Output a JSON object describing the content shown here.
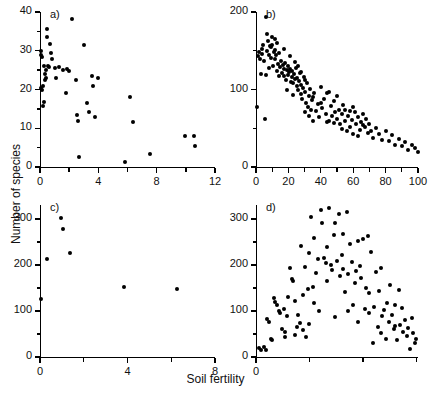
{
  "figure": {
    "xlabel": "Soil fertility",
    "ylabel": "Number of species",
    "point_color": "#000000",
    "axis_color": "#000000",
    "background": "#ffffff"
  },
  "chart_data": [
    {
      "type": "scatter",
      "panel": "a)",
      "title": "",
      "xlabel": "Soil fertility",
      "ylabel": "Number of species",
      "xlim": [
        0,
        12
      ],
      "ylim": [
        0,
        40
      ],
      "xticks": [
        0,
        4,
        8,
        12
      ],
      "xticklabels": [
        "0",
        "4",
        "8",
        "12"
      ],
      "xminorticks": [
        2,
        6,
        10
      ],
      "yticks": [
        0,
        10,
        20,
        30,
        40
      ],
      "yticklabels": [
        "0",
        "10",
        "20",
        "30",
        "40"
      ],
      "yminorticks": [
        5,
        15,
        25,
        35
      ],
      "grid": false,
      "legend": false,
      "points": [
        [
          0.05,
          30.0
        ],
        [
          0.08,
          29.0
        ],
        [
          0.1,
          20.3
        ],
        [
          0.12,
          20.0
        ],
        [
          0.15,
          28.5
        ],
        [
          0.18,
          21.0
        ],
        [
          0.2,
          15.8
        ],
        [
          0.25,
          16.8
        ],
        [
          0.3,
          26.0
        ],
        [
          0.32,
          24.0
        ],
        [
          0.35,
          22.5
        ],
        [
          0.38,
          25.0
        ],
        [
          0.42,
          23.0
        ],
        [
          0.45,
          33.5
        ],
        [
          0.5,
          35.5
        ],
        [
          0.55,
          26.0
        ],
        [
          0.6,
          25.8
        ],
        [
          0.7,
          31.8
        ],
        [
          0.75,
          29.5
        ],
        [
          0.85,
          27.8
        ],
        [
          1.0,
          25.5
        ],
        [
          1.1,
          23.0
        ],
        [
          1.3,
          25.8
        ],
        [
          1.6,
          25.0
        ],
        [
          1.75,
          19.2
        ],
        [
          1.85,
          25.2
        ],
        [
          2.0,
          24.8
        ],
        [
          2.2,
          38.2
        ],
        [
          2.45,
          22.5
        ],
        [
          2.55,
          13.5
        ],
        [
          2.6,
          11.8
        ],
        [
          2.7,
          2.5
        ],
        [
          3.05,
          31.5
        ],
        [
          3.2,
          16.5
        ],
        [
          3.35,
          14.2
        ],
        [
          3.55,
          23.5
        ],
        [
          3.6,
          20.8
        ],
        [
          3.75,
          13.0
        ],
        [
          4.0,
          23.0
        ],
        [
          5.8,
          1.2
        ],
        [
          6.2,
          18.0
        ],
        [
          6.35,
          11.7
        ],
        [
          7.55,
          3.3
        ],
        [
          9.95,
          7.9
        ],
        [
          10.55,
          8.0
        ],
        [
          10.65,
          5.5
        ]
      ]
    },
    {
      "type": "scatter",
      "panel": "b)",
      "title": "",
      "xlabel": "Soil fertility",
      "ylabel": "Number of species",
      "xlim": [
        0,
        100
      ],
      "ylim": [
        0,
        200
      ],
      "xticks": [
        0,
        20,
        40,
        60,
        80,
        100
      ],
      "xticklabels": [
        "0",
        "20",
        "40",
        "60",
        "80",
        "100"
      ],
      "xminorticks": [
        10,
        30,
        50,
        70,
        90
      ],
      "yticks": [
        0,
        100,
        200
      ],
      "yticklabels": [
        "0",
        "100",
        "200"
      ],
      "yminorticks": [
        50,
        150
      ],
      "grid": false,
      "legend": false,
      "points": [
        [
          0.5,
          77
        ],
        [
          1.5,
          143
        ],
        [
          2.0,
          148
        ],
        [
          2.5,
          140
        ],
        [
          3.0,
          120
        ],
        [
          3.5,
          152
        ],
        [
          4.0,
          146
        ],
        [
          4.5,
          158
        ],
        [
          5.0,
          137
        ],
        [
          5.5,
          62
        ],
        [
          6.0,
          193
        ],
        [
          6.5,
          171
        ],
        [
          7.0,
          150
        ],
        [
          7.5,
          162
        ],
        [
          8.0,
          145
        ],
        [
          8.5,
          156
        ],
        [
          9.0,
          141
        ],
        [
          9.5,
          155
        ],
        [
          10.0,
          158
        ],
        [
          10.5,
          130
        ],
        [
          11.0,
          148
        ],
        [
          11.5,
          151
        ],
        [
          12.0,
          139
        ],
        [
          12.5,
          144
        ],
        [
          13.0,
          124
        ],
        [
          13.5,
          133
        ],
        [
          14.0,
          147
        ],
        [
          14.5,
          118
        ],
        [
          15.0,
          129
        ],
        [
          15.5,
          137
        ],
        [
          16.0,
          121
        ],
        [
          16.5,
          131
        ],
        [
          17.0,
          126
        ],
        [
          17.5,
          118
        ],
        [
          18.0,
          134
        ],
        [
          18.5,
          112
        ],
        [
          19.0,
          125
        ],
        [
          19.5,
          130
        ],
        [
          20.0,
          119
        ],
        [
          20.5,
          122
        ],
        [
          21.0,
          127
        ],
        [
          21.5,
          110
        ],
        [
          22.0,
          116
        ],
        [
          22.5,
          124
        ],
        [
          23.0,
          108
        ],
        [
          23.5,
          120
        ],
        [
          24.0,
          113
        ],
        [
          24.5,
          128
        ],
        [
          25.0,
          104
        ],
        [
          25.5,
          115
        ],
        [
          26.0,
          99
        ],
        [
          26.5,
          111
        ],
        [
          27.0,
          121
        ],
        [
          27.5,
          94
        ],
        [
          28.0,
          106
        ],
        [
          28.5,
          88
        ],
        [
          29.0,
          102
        ],
        [
          29.5,
          116
        ],
        [
          30.0,
          71
        ],
        [
          30.5,
          97
        ],
        [
          31.0,
          83
        ],
        [
          31.5,
          109
        ],
        [
          32.0,
          78
        ],
        [
          32.5,
          92
        ],
        [
          33.0,
          66
        ],
        [
          33.5,
          101
        ],
        [
          34.0,
          74
        ],
        [
          34.5,
          86
        ],
        [
          35.0,
          60
        ],
        [
          36.0,
          95
        ],
        [
          37.0,
          72
        ],
        [
          38.0,
          81
        ],
        [
          39.0,
          64
        ],
        [
          40.0,
          103
        ],
        [
          41.0,
          76
        ],
        [
          42.0,
          88
        ],
        [
          43.0,
          69
        ],
        [
          44.0,
          58
        ],
        [
          45.0,
          97
        ],
        [
          46.0,
          79
        ],
        [
          47.0,
          66
        ],
        [
          48.0,
          85
        ],
        [
          49.0,
          71
        ],
        [
          50.0,
          62
        ],
        [
          51.0,
          74
        ],
        [
          52.0,
          55
        ],
        [
          53.0,
          68
        ],
        [
          54.0,
          80
        ],
        [
          55.0,
          59
        ],
        [
          56.0,
          47
        ],
        [
          57.0,
          66
        ],
        [
          58.0,
          52
        ],
        [
          59.0,
          61
        ],
        [
          60.0,
          43
        ],
        [
          61.0,
          71
        ],
        [
          62.0,
          56
        ],
        [
          63.0,
          65
        ],
        [
          64.0,
          48
        ],
        [
          65.0,
          58
        ],
        [
          66.0,
          69
        ],
        [
          67.0,
          51
        ],
        [
          68.0,
          62
        ],
        [
          69.0,
          44
        ],
        [
          70.0,
          55
        ],
        [
          71.0,
          47
        ],
        [
          72.0,
          38
        ],
        [
          74.0,
          50
        ],
        [
          76.0,
          42
        ],
        [
          78.0,
          35
        ],
        [
          80.0,
          46
        ],
        [
          82.0,
          33
        ],
        [
          84.0,
          41
        ],
        [
          86.0,
          29
        ],
        [
          88.0,
          36
        ],
        [
          90.0,
          27
        ],
        [
          92.0,
          32
        ],
        [
          94.0,
          22
        ],
        [
          96.0,
          28
        ],
        [
          98.0,
          24
        ],
        [
          100.0,
          20
        ],
        [
          12.0,
          165
        ],
        [
          17.0,
          152
        ],
        [
          21.0,
          143
        ],
        [
          24.0,
          135
        ],
        [
          26.0,
          130
        ],
        [
          28.0,
          123
        ],
        [
          19.0,
          100
        ],
        [
          23.0,
          93
        ],
        [
          30.0,
          112
        ],
        [
          35.0,
          90
        ],
        [
          40.0,
          83
        ],
        [
          45.0,
          60
        ],
        [
          50.0,
          92
        ],
        [
          55.0,
          73
        ],
        [
          60.0,
          77
        ],
        [
          8.0,
          128
        ],
        [
          6.0,
          119
        ],
        [
          44.0,
          95
        ],
        [
          48.0,
          57
        ],
        [
          53.0,
          49
        ],
        [
          58.0,
          72
        ],
        [
          63.0,
          40
        ],
        [
          66.0,
          54
        ],
        [
          13.0,
          160
        ],
        [
          10.0,
          168
        ]
      ]
    },
    {
      "type": "scatter",
      "panel": "c)",
      "title": "",
      "xlabel": "Soil fertility",
      "ylabel": "Number of species",
      "xlim": [
        0,
        8
      ],
      "ylim": [
        0,
        330
      ],
      "xticks": [
        0,
        4,
        8
      ],
      "xticklabels": [
        "0",
        "4",
        "8"
      ],
      "xminorticks": [
        2,
        6
      ],
      "yticks": [
        0,
        100,
        200,
        300
      ],
      "yticklabels": [
        "0",
        "100",
        "200",
        "300"
      ],
      "yminorticks": [
        50,
        150,
        250
      ],
      "grid": false,
      "legend": false,
      "points": [
        [
          0.05,
          126
        ],
        [
          0.3,
          213
        ],
        [
          0.95,
          302
        ],
        [
          1.05,
          278
        ],
        [
          1.35,
          226
        ],
        [
          3.85,
          153
        ],
        [
          6.25,
          147
        ]
      ]
    },
    {
      "type": "scatter",
      "panel": "d)",
      "title": "",
      "xlabel": "Soil fertility",
      "ylabel": "Number of species",
      "xlim": [
        0,
        100
      ],
      "ylim": [
        0,
        330
      ],
      "xticks": [
        0
      ],
      "xticklabels": [
        "0"
      ],
      "xminorticks": [
        33,
        66,
        99
      ],
      "yticks": [
        0,
        100,
        200,
        300
      ],
      "yticklabels": [
        "0",
        "100",
        "200",
        "300"
      ],
      "yminorticks": [
        50,
        150,
        250
      ],
      "grid": false,
      "legend": false,
      "points": [
        [
          2,
          20
        ],
        [
          3,
          16
        ],
        [
          5,
          22
        ],
        [
          6,
          15
        ],
        [
          7,
          82
        ],
        [
          9,
          40
        ],
        [
          10,
          36
        ],
        [
          11,
          128
        ],
        [
          12,
          120
        ],
        [
          13,
          112
        ],
        [
          14,
          100
        ],
        [
          15,
          96
        ],
        [
          16,
          60
        ],
        [
          17,
          104
        ],
        [
          18,
          55
        ],
        [
          19,
          88
        ],
        [
          20,
          130
        ],
        [
          21,
          193
        ],
        [
          22,
          170
        ],
        [
          23,
          165
        ],
        [
          24,
          48
        ],
        [
          25,
          66
        ],
        [
          26,
          92
        ],
        [
          27,
          74
        ],
        [
          28,
          240
        ],
        [
          29,
          58
        ],
        [
          30,
          196
        ],
        [
          31,
          44
        ],
        [
          32,
          148
        ],
        [
          33,
          226
        ],
        [
          34,
          305
        ],
        [
          35,
          152
        ],
        [
          36,
          258
        ],
        [
          37,
          182
        ],
        [
          38,
          212
        ],
        [
          39,
          100
        ],
        [
          40,
          320
        ],
        [
          41,
          292
        ],
        [
          42,
          216
        ],
        [
          43,
          204
        ],
        [
          44,
          238
        ],
        [
          45,
          324
        ],
        [
          46,
          200
        ],
        [
          47,
          188
        ],
        [
          48,
          264
        ],
        [
          49,
          86
        ],
        [
          50,
          208
        ],
        [
          51,
          310
        ],
        [
          52,
          176
        ],
        [
          53,
          222
        ],
        [
          54,
          192
        ],
        [
          55,
          142
        ],
        [
          56,
          314
        ],
        [
          57,
          180
        ],
        [
          58,
          246
        ],
        [
          59,
          206
        ],
        [
          60,
          112
        ],
        [
          61,
          160
        ],
        [
          62,
          186
        ],
        [
          63,
          252
        ],
        [
          64,
          198
        ],
        [
          65,
          172
        ],
        [
          66,
          256
        ],
        [
          67,
          104
        ],
        [
          68,
          150
        ],
        [
          69,
          262
        ],
        [
          70,
          96
        ],
        [
          71,
          228
        ],
        [
          72,
          30
        ],
        [
          73,
          108
        ],
        [
          74,
          184
        ],
        [
          75,
          66
        ],
        [
          76,
          144
        ],
        [
          77,
          194
        ],
        [
          78,
          88
        ],
        [
          79,
          102
        ],
        [
          80,
          40
        ],
        [
          81,
          118
        ],
        [
          82,
          76
        ],
        [
          83,
          156
        ],
        [
          84,
          92
        ],
        [
          85,
          60
        ],
        [
          86,
          112
        ],
        [
          87,
          36
        ],
        [
          88,
          145
        ],
        [
          89,
          70
        ],
        [
          90,
          106
        ],
        [
          91,
          54
        ],
        [
          92,
          80
        ],
        [
          93,
          46
        ],
        [
          94,
          62
        ],
        [
          95,
          18
        ],
        [
          96,
          84
        ],
        [
          97,
          52
        ],
        [
          98,
          30
        ],
        [
          99,
          38
        ],
        [
          8,
          75
        ],
        [
          24,
          122
        ],
        [
          29,
          134
        ],
        [
          36,
          118
        ],
        [
          44,
          166
        ],
        [
          57,
          100
        ],
        [
          63,
          76
        ],
        [
          70,
          140
        ],
        [
          77,
          52
        ],
        [
          86,
          68
        ],
        [
          18,
          44
        ],
        [
          33,
          72
        ],
        [
          49,
          290
        ],
        [
          54,
          268
        ]
      ]
    }
  ]
}
